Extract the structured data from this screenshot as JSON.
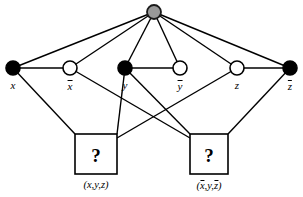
{
  "figure": {
    "type": "graph-diagram",
    "title": "",
    "background": "#ffffff",
    "width": 303,
    "height": 197
  },
  "colors": {
    "edge": "#000000",
    "node_fill_true": "#000000",
    "node_fill_false": "#ffffff",
    "node_stroke": "#000000",
    "apex_fill": "#999999",
    "apex_stroke": "#1a1a1a",
    "box_fill": "#ffffff",
    "box_stroke": "#000000",
    "text": "#000000"
  },
  "nodes": {
    "apex": {
      "name": "apex-node",
      "x": 154,
      "y": 12,
      "r": 7,
      "fill": "gray",
      "label": ""
    },
    "literals": [
      {
        "id": "x",
        "label": "x",
        "overline": false,
        "x": 13,
        "y": 68,
        "r": 7,
        "fill": "black",
        "label_x": 13,
        "label_y": 80
      },
      {
        "id": "xbar",
        "label": "x",
        "overline": true,
        "x": 70,
        "y": 68,
        "r": 7,
        "fill": "white",
        "label_x": 70,
        "label_y": 80
      },
      {
        "id": "y",
        "label": "y",
        "overline": false,
        "x": 125,
        "y": 68,
        "r": 7,
        "fill": "black",
        "label_x": 125,
        "label_y": 80
      },
      {
        "id": "ybar",
        "label": "y",
        "overline": true,
        "x": 180,
        "y": 68,
        "r": 7,
        "fill": "white",
        "label_x": 180,
        "label_y": 80
      },
      {
        "id": "z",
        "label": "z",
        "overline": false,
        "x": 237,
        "y": 68,
        "r": 7,
        "fill": "white",
        "label_x": 237,
        "label_y": 80
      },
      {
        "id": "zbar",
        "label": "z",
        "overline": true,
        "x": 290,
        "y": 68,
        "r": 7,
        "fill": "black",
        "label_x": 290,
        "label_y": 80
      }
    ]
  },
  "clause_boxes": [
    {
      "id": "clause-1",
      "glyph": "?",
      "x": 75,
      "y": 134,
      "w": 42,
      "h": 40,
      "glyph_x": 96,
      "glyph_y": 155,
      "caption_parts": [
        {
          "text": "(",
          "overline": false
        },
        {
          "text": "x",
          "overline": false
        },
        {
          "text": ",",
          "overline": false
        },
        {
          "text": "y",
          "overline": false
        },
        {
          "text": ",",
          "overline": false
        },
        {
          "text": "z",
          "overline": false
        },
        {
          "text": ")",
          "overline": false
        }
      ],
      "caption_plain": "(x, y, z)",
      "caption_x": 96,
      "caption_y": 180
    },
    {
      "id": "clause-2",
      "glyph": "?",
      "x": 190,
      "y": 134,
      "w": 38,
      "h": 40,
      "glyph_x": 209,
      "glyph_y": 155,
      "caption_parts": [
        {
          "text": "(",
          "overline": false
        },
        {
          "text": "x",
          "overline": true
        },
        {
          "text": ",",
          "overline": false
        },
        {
          "text": "y",
          "overline": false
        },
        {
          "text": ",",
          "overline": false
        },
        {
          "text": "z",
          "overline": true
        },
        {
          "text": ")",
          "overline": false
        }
      ],
      "caption_plain": "(x̄, y, z̄)",
      "caption_x": 209,
      "caption_y": 180
    }
  ],
  "edges": [
    {
      "from": "apex",
      "to": "x",
      "x1": 154,
      "y1": 12,
      "x2": 13,
      "y2": 68
    },
    {
      "from": "apex",
      "to": "xbar",
      "x1": 154,
      "y1": 12,
      "x2": 70,
      "y2": 68
    },
    {
      "from": "apex",
      "to": "y",
      "x1": 154,
      "y1": 12,
      "x2": 125,
      "y2": 68
    },
    {
      "from": "apex",
      "to": "ybar",
      "x1": 154,
      "y1": 12,
      "x2": 180,
      "y2": 68
    },
    {
      "from": "apex",
      "to": "z",
      "x1": 154,
      "y1": 12,
      "x2": 237,
      "y2": 68
    },
    {
      "from": "apex",
      "to": "zbar",
      "x1": 154,
      "y1": 12,
      "x2": 290,
      "y2": 68
    },
    {
      "from": "x",
      "to": "xbar",
      "x1": 13,
      "y1": 68,
      "x2": 70,
      "y2": 68
    },
    {
      "from": "y",
      "to": "ybar",
      "x1": 125,
      "y1": 68,
      "x2": 180,
      "y2": 68
    },
    {
      "from": "z",
      "to": "zbar",
      "x1": 237,
      "y1": 68,
      "x2": 290,
      "y2": 68
    },
    {
      "from": "x",
      "to": "clause-1",
      "x1": 13,
      "y1": 68,
      "x2": 75,
      "y2": 134
    },
    {
      "from": "y",
      "to": "clause-1",
      "x1": 125,
      "y1": 68,
      "x2": 117,
      "y2": 134
    },
    {
      "from": "z",
      "to": "clause-1",
      "x1": 237,
      "y1": 68,
      "x2": 117,
      "y2": 138
    },
    {
      "from": "xbar",
      "to": "clause-2",
      "x1": 70,
      "y1": 68,
      "x2": 190,
      "y2": 138
    },
    {
      "from": "y",
      "to": "clause-2",
      "x1": 125,
      "y1": 68,
      "x2": 190,
      "y2": 134
    },
    {
      "from": "zbar",
      "to": "clause-2",
      "x1": 290,
      "y1": 68,
      "x2": 228,
      "y2": 134
    }
  ]
}
